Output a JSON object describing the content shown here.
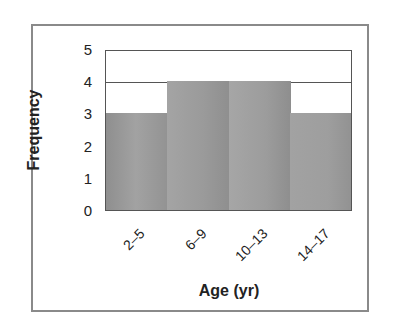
{
  "chart_data": {
    "type": "bar",
    "title": "",
    "xlabel": "Age (yr)",
    "ylabel": "Frequency",
    "categories": [
      "2–5",
      "6–9",
      "10–13",
      "14–17"
    ],
    "values": [
      3,
      4,
      4,
      3
    ],
    "ylim": [
      0,
      5
    ],
    "yticks": [
      "0",
      "1",
      "2",
      "3",
      "4",
      "5"
    ],
    "grid": "horizontal lines at 4 and 5",
    "legend": "none",
    "bar_style": "histogram (adjacent bars, no gaps), gray gradient fill",
    "colors": {
      "bar_fill": "#9a9a9a",
      "bar_fill_alt": "#a8a8a8",
      "frame": "#8a8a8a",
      "axis": "#555555"
    }
  }
}
